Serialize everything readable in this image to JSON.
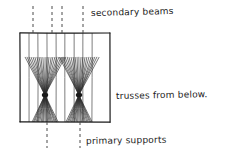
{
  "diagram": {
    "background_color": "#ffffff",
    "ink_color": "#1a1a1a",
    "canvas": {
      "width": 227,
      "height": 153
    },
    "slab": {
      "name": "floor slab outline",
      "x": 20,
      "y": 33,
      "width": 90,
      "height": 89,
      "stroke_color": "#1a1a1a",
      "stroke_width": 1.2
    },
    "secondary_beam_lines": {
      "count": 8,
      "x_positions": [
        29,
        38,
        47,
        56,
        65,
        74,
        83,
        92
      ],
      "y_top": 33,
      "y_bottom": 122,
      "stroke_color": "#6f6f6f",
      "stroke_width": 0.9
    },
    "grid_lines_top": {
      "count": 4,
      "x_positions": [
        33,
        52,
        62,
        83
      ],
      "y_from": 6,
      "y_to": 33,
      "dash": "3,3",
      "stroke_color": "#4a4a4a"
    },
    "grid_lines_bottom": {
      "count": 2,
      "x_positions": [
        47,
        80
      ],
      "y_from": 122,
      "y_to": 148,
      "dash": "3,3",
      "stroke_color": "#4a4a4a"
    },
    "trusses": [
      {
        "name": "truss-fan-left",
        "cx": 45,
        "cy": 95,
        "ray_count": 21,
        "node_radius": 3.2
      },
      {
        "name": "truss-fan-right",
        "cx": 79,
        "cy": 95,
        "ray_count": 21,
        "node_radius": 3.2
      }
    ],
    "truss_fan": {
      "top_spread_half_width": 20,
      "top_y": 57,
      "bottom_spread_half_width": 13,
      "bottom_y": 122,
      "stroke_color": "#2b2b2b",
      "stroke_width": 0.65
    }
  },
  "annotations": [
    {
      "id": "secondary-beams",
      "text": "secondary beams",
      "x": 91,
      "y": 16,
      "anchor": "start"
    },
    {
      "id": "trusses-from-below",
      "text": "trusses from below.",
      "x": 116,
      "y": 99,
      "anchor": "start"
    },
    {
      "id": "primary-supports",
      "text": "primary supports",
      "x": 86,
      "y": 144,
      "anchor": "start"
    }
  ]
}
